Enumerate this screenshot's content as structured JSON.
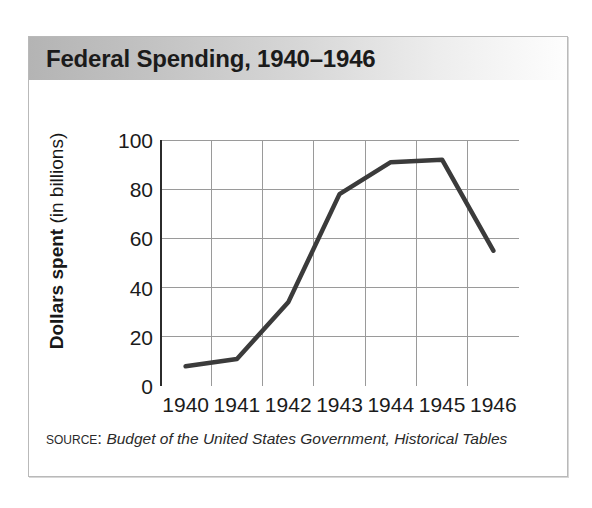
{
  "figure": {
    "title": "Federal Spending, 1940–1946",
    "source_label": "Source:",
    "source_title": "Budget of the United States Government, Historical Tables"
  },
  "axis": {
    "y_title_bold": "Dollars spent",
    "y_title_regular": " (in billions)"
  },
  "colors": {
    "line": "#3b3b3b",
    "grid": "#9a9a9a",
    "axis": "#2b2b2b",
    "title_bar_left": "#b4b4b4",
    "title_bar_right": "#fdfdfd",
    "frame_border": "#b9b9b9"
  },
  "chart_data": {
    "type": "line",
    "title": "Federal Spending, 1940–1946",
    "xlabel": "",
    "ylabel": "Dollars spent (in billions)",
    "categories": [
      "1940",
      "1941",
      "1942",
      "1943",
      "1944",
      "1945",
      "1946"
    ],
    "values": [
      8,
      11,
      34,
      78,
      91,
      92,
      55
    ],
    "ylim": [
      0,
      100
    ],
    "yticks": [
      0,
      20,
      40,
      60,
      80,
      100
    ],
    "ytick_labels": [
      "0",
      "20",
      "40",
      "60",
      "80",
      "100"
    ],
    "xtick_labels": [
      "1940",
      "1941",
      "1942",
      "1943",
      "1944",
      "1945",
      "1946"
    ],
    "grid": true,
    "legend": false,
    "series": [
      {
        "name": "Federal spending",
        "values": [
          8,
          11,
          34,
          78,
          91,
          92,
          55
        ]
      }
    ]
  }
}
